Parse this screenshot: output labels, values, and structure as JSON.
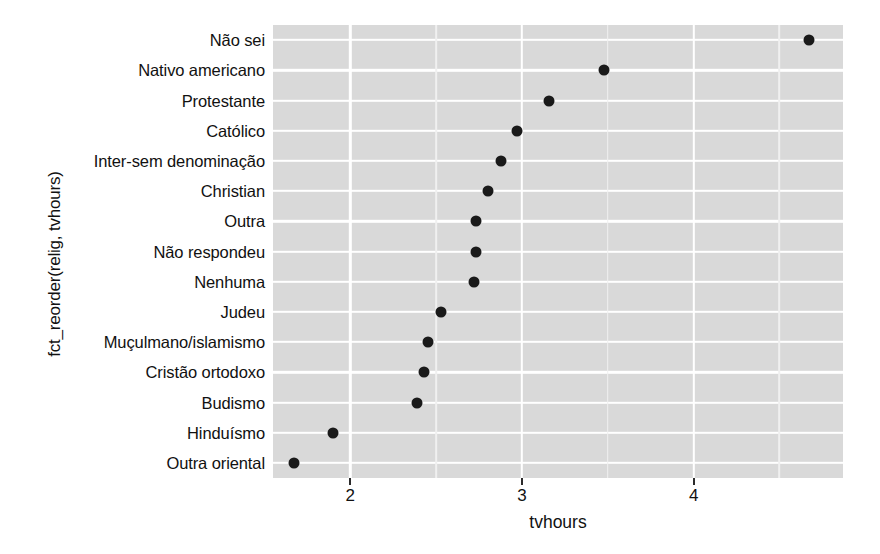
{
  "chart_data": {
    "type": "scatter",
    "title": "",
    "xlabel": "tvhours",
    "ylabel": "fct_reorder(relig, tvhours)",
    "xlim": [
      1.55,
      4.87
    ],
    "ylim_categories": 15,
    "grid": true,
    "legend": "none",
    "x_ticks": [
      "2",
      "3",
      "4"
    ],
    "x_tick_values": [
      2,
      3,
      4
    ],
    "x_minor_ticks": [
      2.5,
      3.5,
      4.5
    ],
    "categories": [
      "Não sei",
      "Nativo americano",
      "Protestante",
      "Católico",
      "Inter-sem denominação",
      "Christian",
      "Outra",
      "Não respondeu",
      "Nenhuma",
      "Judeu",
      "Muçulmano/islamismo",
      "Cristão ortodoxo",
      "Budismo",
      "Hinduísmo",
      "Outra oriental"
    ],
    "values": [
      4.67,
      3.48,
      3.16,
      2.97,
      2.88,
      2.8,
      2.73,
      2.73,
      2.72,
      2.53,
      2.45,
      2.43,
      2.39,
      1.9,
      1.67
    ],
    "point_color": "#1a1a1a",
    "panel_color": "#d9d9d9",
    "grid_color": "#ffffff"
  }
}
